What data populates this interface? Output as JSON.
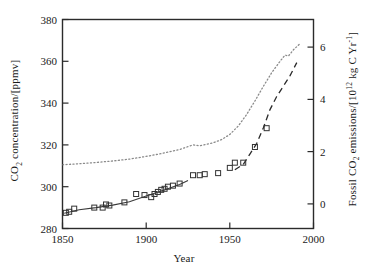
{
  "chart_data": {
    "type": "scatter",
    "title": "",
    "xlabel": "Year",
    "xlim": [
      1850,
      2000
    ],
    "xticks": [
      1850,
      1900,
      1950,
      2000
    ],
    "xticklabels": [
      "1850",
      "1900",
      "1950",
      "2000"
    ],
    "grid": false,
    "legend": "none",
    "axes": [
      {
        "id": "left",
        "label_parts": {
          "pre": "CO",
          "sub": "2",
          "post": " concentration/[ppmv]"
        },
        "label_text": "CO2 concentration/[ppmv]",
        "ylim": [
          280,
          380
        ],
        "yticks": [
          280,
          300,
          320,
          340,
          360,
          380
        ],
        "yticklabels": [
          "280",
          "300",
          "320",
          "340",
          "360",
          "380"
        ]
      },
      {
        "id": "right",
        "label_parts": {
          "pre": "Fossil CO",
          "sub": "2",
          "mid": " emissions/[10",
          "sup": "12",
          "post": " kg C Yr",
          "sup2": "-1",
          "tail": "]"
        },
        "label_text": "Fossil CO2 emissions/[10^12 kg C Yr^-1]",
        "ylim": [
          -1.5,
          6.5
        ],
        "yticks": [
          0,
          2,
          4,
          6
        ],
        "yticklabels": [
          "0",
          "2",
          "4",
          "6"
        ]
      }
    ],
    "series": [
      {
        "name": "Ice-core / observed CO2 concentration (markers)",
        "type": "scatter",
        "axis": "left",
        "marker": "open-square",
        "marker_size_px": 5,
        "color": "#333333",
        "points": [
          [
            1852,
            287.5
          ],
          [
            1854,
            288.0
          ],
          [
            1857,
            289.5
          ],
          [
            1869,
            290.0
          ],
          [
            1874,
            290.0
          ],
          [
            1876,
            291.5
          ],
          [
            1878,
            291.0
          ],
          [
            1887,
            292.5
          ],
          [
            1894,
            296.5
          ],
          [
            1899,
            296.0
          ],
          [
            1903,
            295.0
          ],
          [
            1905,
            296.5
          ],
          [
            1907,
            297.5
          ],
          [
            1909,
            298.5
          ],
          [
            1911,
            299.0
          ],
          [
            1913,
            300.0
          ],
          [
            1916,
            300.5
          ],
          [
            1920,
            301.5
          ],
          [
            1928,
            305.5
          ],
          [
            1932,
            305.5
          ],
          [
            1935,
            306.0
          ],
          [
            1943,
            306.5
          ],
          [
            1950,
            309.0
          ],
          [
            1953,
            311.5
          ],
          [
            1958,
            311.5
          ],
          [
            1965,
            319.0
          ],
          [
            1972,
            328.0
          ]
        ]
      },
      {
        "name": "CO2 concentration fit (solid line)",
        "type": "line",
        "axis": "left",
        "linestyle": "solid",
        "color": "#333333",
        "points": [
          [
            1851,
            287.3
          ],
          [
            1860,
            289.0
          ],
          [
            1870,
            290.0
          ],
          [
            1880,
            291.2
          ],
          [
            1890,
            292.8
          ],
          [
            1900,
            295.5
          ],
          [
            1910,
            298.2
          ],
          [
            1920,
            301.0
          ],
          [
            1925,
            303.0
          ]
        ]
      },
      {
        "name": "Modelled CO2 concentration (dotted curve)",
        "type": "line",
        "axis": "left",
        "linestyle": "dotted",
        "color": "#7a7a7a",
        "points": [
          [
            1850,
            310.5
          ],
          [
            1860,
            311.0
          ],
          [
            1870,
            311.6
          ],
          [
            1880,
            312.3
          ],
          [
            1890,
            313.2
          ],
          [
            1900,
            314.5
          ],
          [
            1910,
            316.0
          ],
          [
            1920,
            317.8
          ],
          [
            1928,
            320.0
          ],
          [
            1932,
            319.6
          ],
          [
            1936,
            320.3
          ],
          [
            1940,
            321.0
          ],
          [
            1945,
            322.5
          ],
          [
            1950,
            325.0
          ],
          [
            1955,
            329.0
          ],
          [
            1960,
            334.5
          ],
          [
            1965,
            341.0
          ],
          [
            1970,
            348.0
          ],
          [
            1975,
            354.5
          ],
          [
            1980,
            360.0
          ],
          [
            1983,
            363.0
          ],
          [
            1985,
            362.5
          ],
          [
            1988,
            365.5
          ],
          [
            1990,
            367.0
          ],
          [
            1992,
            368.5
          ]
        ]
      },
      {
        "name": "Fossil CO2 emissions (dashed curve)",
        "type": "line",
        "axis": "right",
        "linestyle": "dashed",
        "color": "#333333",
        "points": [
          [
            1953,
            0.75
          ],
          [
            1958,
            0.95
          ],
          [
            1962,
            1.35
          ],
          [
            1966,
            1.75
          ],
          [
            1970,
            2.35
          ],
          [
            1974,
            3.05
          ],
          [
            1978,
            3.55
          ],
          [
            1982,
            3.95
          ],
          [
            1986,
            4.35
          ],
          [
            1990,
            4.85
          ]
        ]
      }
    ]
  }
}
